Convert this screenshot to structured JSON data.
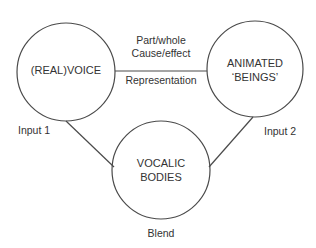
{
  "diagram": {
    "stroke_color": "#4a4a4a",
    "text_color": "#333333",
    "nodes": [
      {
        "id": "input1",
        "lines": [
          "(REAL)VOICE"
        ],
        "caption": "Input 1"
      },
      {
        "id": "input2",
        "lines": [
          "ANIMATED",
          "‘BEINGS’"
        ],
        "caption": "Input 2"
      },
      {
        "id": "blend",
        "lines": [
          "VOCALIC",
          "BODIES"
        ],
        "caption": "Blend"
      }
    ],
    "edges": [
      {
        "from": "input1",
        "to": "input2",
        "labels_above": [
          "Part/whole",
          "Cause/effect"
        ],
        "labels_below": [
          "Representation"
        ]
      },
      {
        "from": "input1",
        "to": "blend"
      },
      {
        "from": "input2",
        "to": "blend"
      }
    ]
  }
}
